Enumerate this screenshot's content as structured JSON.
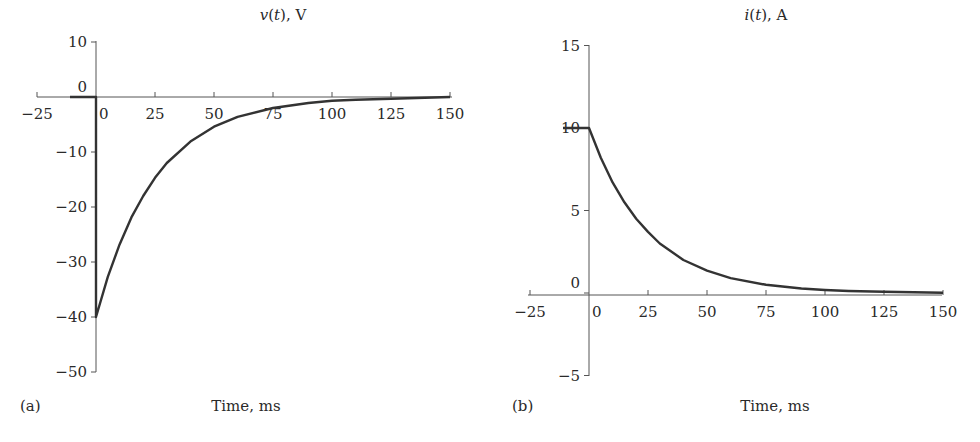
{
  "chart_data": [
    {
      "panel": "(a)",
      "type": "line",
      "title": "v(t), V",
      "title_parts": {
        "symbol": "v",
        "arg": "t",
        "unit": "V"
      },
      "xlabel": "Time, ms",
      "ylabel": "",
      "xlim": [
        -25,
        150
      ],
      "ylim": [
        -50,
        10
      ],
      "xticks": [
        -25,
        0,
        25,
        50,
        75,
        100,
        125,
        150
      ],
      "yticks": [
        10,
        0,
        -10,
        -20,
        -30,
        -40,
        -50
      ],
      "grid": false,
      "legend": null,
      "series": [
        {
          "name": "v(t)",
          "x": [
            -11,
            0,
            0,
            5,
            10,
            15,
            20,
            25,
            30,
            40,
            50,
            60,
            75,
            90,
            100,
            110,
            125,
            150
          ],
          "values": [
            0,
            0,
            -40,
            -32.7,
            -26.8,
            -21.9,
            -18.0,
            -14.7,
            -12.0,
            -8.1,
            -5.4,
            -3.6,
            -2.0,
            -1.1,
            -0.7,
            -0.5,
            -0.3,
            0
          ]
        }
      ],
      "annotations": [
        "v = 0 for t < 0",
        "jumps to -40 V at t = 0",
        "decays exponentially toward 0 (tau ~ 25 ms)"
      ]
    },
    {
      "panel": "(b)",
      "type": "line",
      "title": "i(t), A",
      "title_parts": {
        "symbol": "i",
        "arg": "t",
        "unit": "A"
      },
      "xlabel": "Time, ms",
      "ylabel": "",
      "xlim": [
        -25,
        150
      ],
      "ylim": [
        -5,
        15
      ],
      "xticks": [
        -25,
        0,
        25,
        50,
        75,
        100,
        125,
        150
      ],
      "yticks": [
        15,
        10,
        5,
        0,
        -5
      ],
      "grid": false,
      "legend": null,
      "series": [
        {
          "name": "i(t)",
          "x": [
            -11,
            0,
            5,
            10,
            15,
            20,
            25,
            30,
            40,
            50,
            60,
            75,
            90,
            100,
            110,
            125,
            150
          ],
          "values": [
            10,
            10,
            8.2,
            6.7,
            5.5,
            4.5,
            3.7,
            3.0,
            2.0,
            1.35,
            0.9,
            0.5,
            0.27,
            0.18,
            0.12,
            0.07,
            0.02
          ]
        }
      ],
      "annotations": [
        "i = 10 A for t < 0",
        "decays exponentially from 10 A toward 0 (tau ~ 25 ms)"
      ]
    }
  ],
  "panels": {
    "a": {
      "label": "(a)",
      "title_symbol": "v",
      "title_paren_open": "(",
      "title_arg": "t",
      "title_rest": "), V",
      "xlabel": "Time, ms",
      "xtick_labels": [
        "−25",
        "0",
        "25",
        "50",
        "75",
        "100",
        "125",
        "150"
      ],
      "ytick_labels": [
        "10",
        "0",
        "−10",
        "−20",
        "−30",
        "−40",
        "−50"
      ]
    },
    "b": {
      "label": "(b)",
      "title_symbol": "i",
      "title_paren_open": "(",
      "title_arg": "t",
      "title_rest": "), A",
      "xlabel": "Time, ms",
      "xtick_labels": [
        "−25",
        "0",
        "25",
        "50",
        "75",
        "100",
        "125",
        "150"
      ],
      "ytick_labels": [
        "15",
        "10",
        "5",
        "0",
        "−5"
      ]
    }
  },
  "colors": {
    "curve": "#333333",
    "axis": "#555555",
    "text": "#2a2a2a",
    "background": "#ffffff"
  }
}
